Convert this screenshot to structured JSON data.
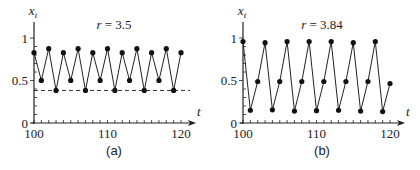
{
  "chart_data": [
    {
      "type": "line",
      "panel_label": "(a)",
      "annotation": "r = 3.5",
      "param_name": "r",
      "param_value": "3.5",
      "xlabel": "t",
      "ylabel": "x_t",
      "xlim": [
        100,
        120
      ],
      "ylim": [
        0,
        1
      ],
      "x_ticks": [
        100,
        110,
        120
      ],
      "y_ticks": [
        0,
        0.5,
        1
      ],
      "y_tick_labels": [
        "0",
        "0.5",
        "1"
      ],
      "x": [
        100,
        101,
        102,
        103,
        104,
        105,
        106,
        107,
        108,
        109,
        110,
        111,
        112,
        113,
        114,
        115,
        116,
        117,
        118,
        119,
        120
      ],
      "values": [
        0.827,
        0.501,
        0.875,
        0.383,
        0.827,
        0.501,
        0.875,
        0.383,
        0.827,
        0.501,
        0.875,
        0.383,
        0.827,
        0.501,
        0.875,
        0.383,
        0.827,
        0.501,
        0.875,
        0.383,
        0.827
      ],
      "reference_line": {
        "y": 0.383,
        "style": "dashed"
      },
      "markers": true,
      "grid": false
    },
    {
      "type": "line",
      "panel_label": "(b)",
      "annotation": "r = 3.84",
      "param_name": "r",
      "param_value": "3.84",
      "xlabel": "t",
      "ylabel": "x_t",
      "xlim": [
        100,
        120
      ],
      "ylim": [
        0,
        1
      ],
      "x_ticks": [
        100,
        110,
        120
      ],
      "y_ticks": [
        0,
        0.5,
        1
      ],
      "y_tick_labels": [
        "0",
        "0.5",
        "1"
      ],
      "x": [
        100,
        101,
        102,
        103,
        104,
        105,
        106,
        107,
        108,
        109,
        110,
        111,
        112,
        113,
        114,
        115,
        116,
        117,
        118,
        119,
        120
      ],
      "values": [
        0.959,
        0.15,
        0.488,
        0.945,
        0.155,
        0.488,
        0.959,
        0.14,
        0.488,
        0.959,
        0.145,
        0.488,
        0.959,
        0.15,
        0.488,
        0.945,
        0.14,
        0.488,
        0.959,
        0.135,
        0.465
      ],
      "markers": true,
      "grid": false
    }
  ]
}
